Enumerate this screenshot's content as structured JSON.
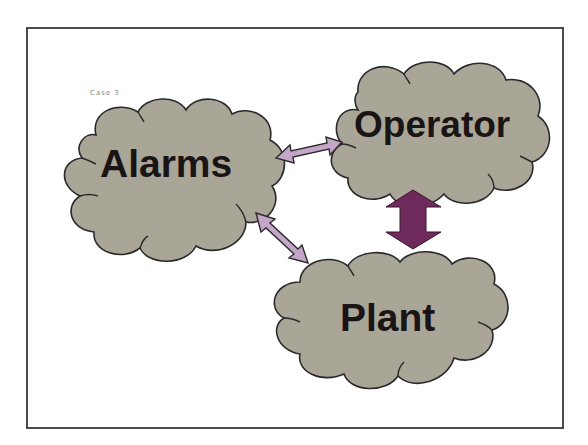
{
  "diagram": {
    "case_label": "Case 3",
    "nodes": [
      {
        "id": "alarms",
        "label": "Alarms"
      },
      {
        "id": "operator",
        "label": "Operator"
      },
      {
        "id": "plant",
        "label": "Plant"
      }
    ],
    "edges": [
      {
        "from": "alarms",
        "to": "operator",
        "type": "bidirectional",
        "style": "thin"
      },
      {
        "from": "alarms",
        "to": "plant",
        "type": "bidirectional",
        "style": "thin"
      },
      {
        "from": "operator",
        "to": "plant",
        "type": "bidirectional",
        "style": "thick"
      }
    ],
    "colors": {
      "cloud_fill": "#a9a697",
      "cloud_stroke": "#2a2a2a",
      "thin_arrow_fill": "#c4a6c8",
      "thick_arrow_fill": "#6e2a5a",
      "frame": "#4a4a4a"
    }
  }
}
